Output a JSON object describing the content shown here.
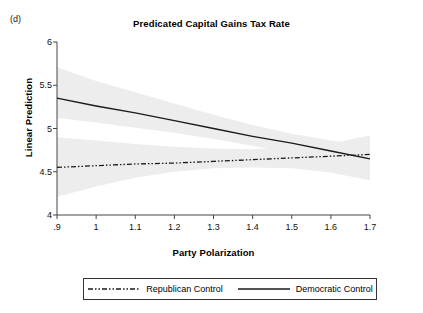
{
  "figure": {
    "panel_label": "(d)",
    "title": "Predicated Capital Gains Tax Rate"
  },
  "axes": {
    "x_title": "Party Polarization",
    "y_title": "Linear Prediction",
    "x_ticks": [
      ".9",
      "1",
      "1.1",
      "1.2",
      "1.3",
      "1.4",
      "1.5",
      "1.6",
      "1.7"
    ],
    "y_ticks": [
      "4",
      "4.5",
      "5",
      "5.5",
      "6"
    ]
  },
  "legend": {
    "items": [
      {
        "label": "Republican Control",
        "style": "dash-dot-dot",
        "color": "#1a1a1a"
      },
      {
        "label": "Democratic Control",
        "style": "solid",
        "color": "#1a1a1a"
      }
    ]
  },
  "colors": {
    "line": "#1a1a1a",
    "ci_band": "#ededed",
    "axis": "#444444",
    "background": "#ffffff"
  },
  "chart_data": {
    "type": "line",
    "title": "Predicated Capital Gains Tax Rate",
    "subtitle": "(d)",
    "xlabel": "Party Polarization",
    "ylabel": "Linear Prediction",
    "xlim": [
      0.9,
      1.7
    ],
    "ylim": [
      4,
      6
    ],
    "xticks": [
      0.9,
      1.0,
      1.1,
      1.2,
      1.3,
      1.4,
      1.5,
      1.6,
      1.7
    ],
    "yticks": [
      4,
      4.5,
      5,
      5.5,
      6
    ],
    "grid": false,
    "legend_position": "below-plot",
    "x": [
      0.9,
      1.0,
      1.1,
      1.2,
      1.3,
      1.4,
      1.5,
      1.6,
      1.7
    ],
    "series": [
      {
        "name": "Democratic Control",
        "style": "solid",
        "values": [
          5.35,
          5.26,
          5.18,
          5.09,
          5.0,
          4.91,
          4.83,
          4.74,
          4.65
        ],
        "ci_lower": [
          5.12,
          5.07,
          5.01,
          4.95,
          4.88,
          4.8,
          4.71,
          4.61,
          4.5
        ],
        "ci_upper": [
          5.71,
          5.55,
          5.42,
          5.29,
          5.16,
          5.04,
          4.94,
          4.86,
          4.8
        ]
      },
      {
        "name": "Republican Control",
        "style": "dash-dot-dot",
        "values": [
          4.55,
          4.57,
          4.59,
          4.6,
          4.62,
          4.64,
          4.66,
          4.68,
          4.7
        ],
        "ci_lower": [
          4.21,
          4.33,
          4.43,
          4.5,
          4.54,
          4.55,
          4.54,
          4.49,
          4.4
        ],
        "ci_upper": [
          4.9,
          4.86,
          4.82,
          4.79,
          4.77,
          4.76,
          4.78,
          4.83,
          4.92
        ]
      }
    ]
  }
}
